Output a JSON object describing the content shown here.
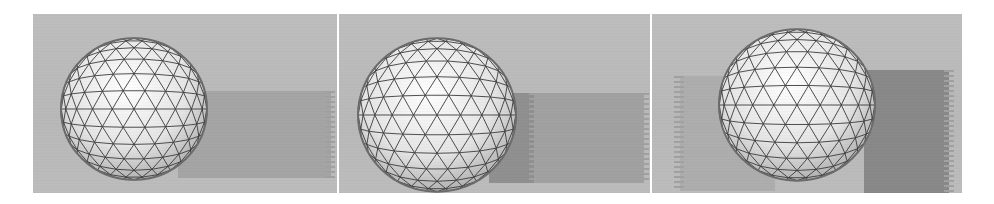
{
  "figure": {
    "panels": [
      {
        "id": "panel-1",
        "description": "Geodesic wireframe sphere on gray floor, shadow to the right",
        "sphere": {
          "cx": 101,
          "cy": 95,
          "r": 73
        },
        "shadow": {
          "x": 145,
          "y": 77,
          "w": 155,
          "h": 87,
          "color": "#a3a3a3"
        }
      },
      {
        "id": "panel-2",
        "description": "Geodesic wireframe sphere on gray floor, darker shadow to the right",
        "sphere": {
          "cx": 98,
          "cy": 101,
          "r": 79
        },
        "shadow": {
          "x": 150,
          "y": 77,
          "w": 155,
          "h": 90,
          "color": "#9c9c9c",
          "dark_x": 150,
          "dark_w": 45,
          "dark_color": "#8e8e8e"
        }
      },
      {
        "id": "panel-3",
        "description": "Geodesic wireframe sphere on gray floor, shadows on both sides",
        "sphere": {
          "cx": 145,
          "cy": 91,
          "r": 78
        },
        "shadow_left": {
          "x": 30,
          "y": 60,
          "w": 90,
          "h": 115,
          "color": "#adadad"
        },
        "shadow_right": {
          "x": 210,
          "y": 56,
          "w": 90,
          "h": 125,
          "color": "#8a8a8a"
        }
      }
    ],
    "colors": {
      "background": "#ffffff",
      "floor": "#b9b9b9",
      "sphere_fill": "#e8e8e8",
      "wire": "#3a3a3a"
    }
  }
}
